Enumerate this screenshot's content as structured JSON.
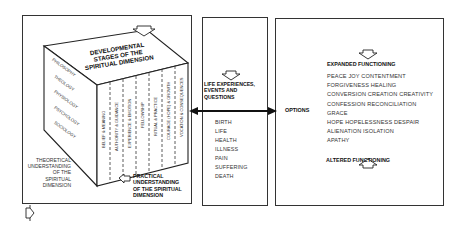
{
  "cube": {
    "top_title": [
      "DEVELOPMENTAL",
      "STAGES OF THE",
      "SPIRITUAL DIMENSION"
    ],
    "left_face": [
      "PHILOSOPHY",
      "THEOLOGY",
      "PHYSIOLOGY",
      "PSYCHOLOGY",
      "SOCIOLOGY"
    ],
    "front_face": [
      "BELIEF & MEANING",
      "AUTHORITY & GUIDANCE",
      "EXPERIENCE & EMOTION",
      "FELLOWSHIP",
      "RITUAL & PRACTICE",
      "COURAGE (HOPE) & GROWTH",
      "VOCATION & CONSEQUENCES"
    ]
  },
  "left_panel": {
    "theoretical_label": [
      "THEORETICAL",
      "UNDERSTANDING",
      "OF THE",
      "SPIRITUAL",
      "DIMENSION"
    ],
    "practical_label": [
      "PRACTICAL",
      "UNDERSTANDING",
      "OF THE SPIRITUAL",
      "DIMENSION"
    ]
  },
  "middle_panel": {
    "title": [
      "LIFE EXPERIENCES,",
      "EVENTS AND",
      "QUESTIONS"
    ],
    "items": [
      "BIRTH",
      "LIFE",
      "HEALTH",
      "ILLNESS",
      "PAIN",
      "SUFFERING",
      "DEATH"
    ]
  },
  "right_panel": {
    "options_label": "OPTIONS",
    "expanded_label": "EXPANDED FUNCTIONING",
    "items": [
      "PEACE JOY CONTENTMENT",
      "FORGIVENESS HEALING",
      "CONVERSION CREATION CREATIVITY",
      "CONFESSION RECONCILIATION",
      "GRACE",
      "HOPE HOPELESSNESS DESPAIR",
      "ALIENATION ISOLATION",
      "APATHY"
    ],
    "altered_label": "ALTERED FUNCTIONING"
  },
  "icons": {
    "arrow_down_top": "hollow-arrow-down",
    "arrow_practical": "hollow-arrow-left",
    "arrow_bottom_left": "hollow-arrow-right",
    "arrow_double": "double-headed-arrow"
  }
}
